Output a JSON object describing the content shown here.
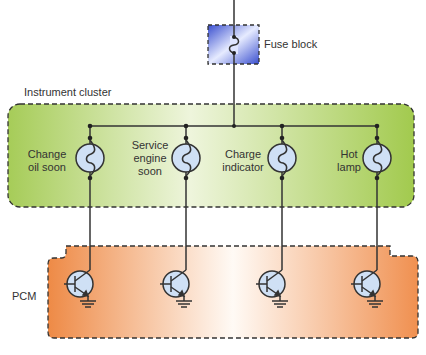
{
  "labels": {
    "fuse_block": "Fuse block",
    "instrument_cluster": "Instrument cluster",
    "pcm": "PCM"
  },
  "lamps": [
    {
      "line1": "Change",
      "line2": "oil soon",
      "line3": ""
    },
    {
      "line1": "Service",
      "line2": "engine",
      "line3": "soon"
    },
    {
      "line1": "Charge",
      "line2": "indicator",
      "line3": ""
    },
    {
      "line1": "Hot",
      "line2": "lamp",
      "line3": ""
    }
  ],
  "colors": {
    "cluster_fill": "#a9cf5a",
    "pcm_fill": "#f0904a",
    "fuse_fill": "#4a5fd0",
    "lamp_fill": "#cfe0f5",
    "wire": "#333333"
  }
}
